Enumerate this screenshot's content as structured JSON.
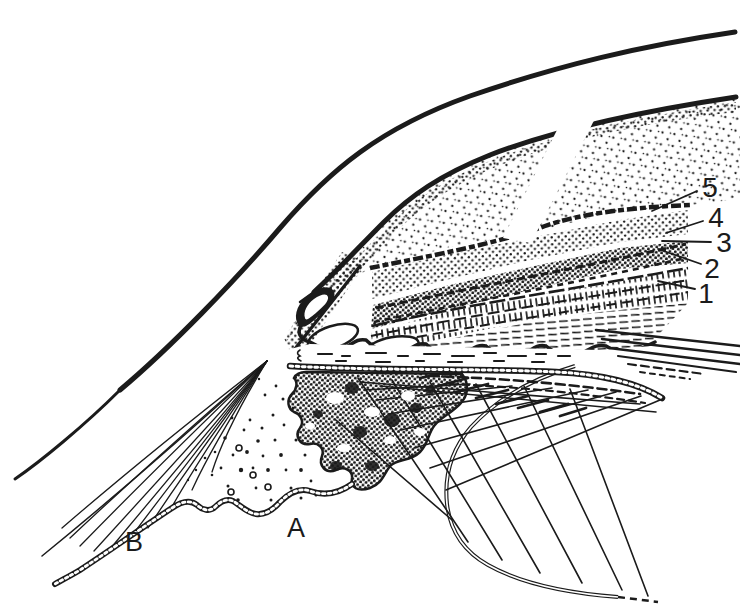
{
  "figure": {
    "background_color": "#ffffff",
    "ink_color": "#1b1b1b",
    "callouts": [
      {
        "text": "5"
      },
      {
        "text": "4"
      },
      {
        "text": "3"
      },
      {
        "text": "2"
      },
      {
        "text": "1"
      }
    ],
    "letters": [
      {
        "text": "A"
      },
      {
        "text": "B"
      }
    ]
  }
}
